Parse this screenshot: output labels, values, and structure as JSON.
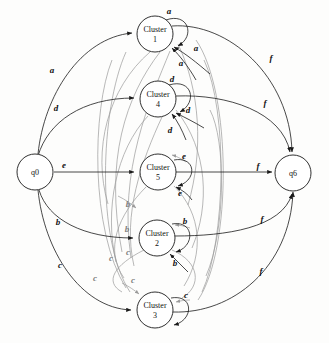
{
  "diagram": {
    "type": "state-transition-diagram",
    "colors": {
      "black_edge": "#1a1a1a",
      "gray_edge": "#9a9a9a",
      "node_fill": "#ffffff",
      "text": "#111111"
    },
    "nodes": [
      {
        "id": "q0",
        "label_line1": "q0",
        "label_line2": "",
        "cx": 35,
        "cy": 172,
        "r": 18
      },
      {
        "id": "c1",
        "label_line1": "Cluster",
        "label_line2": "1",
        "cx": 155,
        "cy": 34,
        "r": 18
      },
      {
        "id": "c4",
        "label_line1": "Cluster",
        "label_line2": "4",
        "cx": 158,
        "cy": 99,
        "r": 18
      },
      {
        "id": "c5",
        "label_line1": "Cluster",
        "label_line2": "5",
        "cx": 158,
        "cy": 172,
        "r": 18
      },
      {
        "id": "c2",
        "label_line1": "Cluster",
        "label_line2": "2",
        "cx": 157,
        "cy": 238,
        "r": 18
      },
      {
        "id": "c3",
        "label_line1": "Cluster",
        "label_line2": "3",
        "cx": 155,
        "cy": 310,
        "r": 18
      }
    ],
    "edge_labels": [
      {
        "id": "a-from-q0",
        "text": "a",
        "x": 52,
        "y": 73,
        "color": "black"
      },
      {
        "id": "d-from-q0",
        "text": "d",
        "x": 56,
        "y": 111,
        "color": "black"
      },
      {
        "id": "e-from-q0",
        "text": "e",
        "x": 64,
        "y": 168,
        "color": "black"
      },
      {
        "id": "b-from-q0",
        "text": "b",
        "x": 58,
        "y": 225,
        "color": "black"
      },
      {
        "id": "c-from-q0",
        "text": "c",
        "x": 60,
        "y": 268,
        "color": "black"
      },
      {
        "id": "a-selfloop",
        "text": "a",
        "x": 169,
        "y": 14,
        "color": "black"
      },
      {
        "id": "a-return-1",
        "text": "a",
        "x": 196,
        "y": 51,
        "color": "black"
      },
      {
        "id": "a-return-2",
        "text": "a",
        "x": 181,
        "y": 66,
        "color": "black"
      },
      {
        "id": "d-selfloop",
        "text": "d",
        "x": 172,
        "y": 82,
        "color": "black"
      },
      {
        "id": "d-return-1",
        "text": "d",
        "x": 188,
        "y": 113,
        "color": "black"
      },
      {
        "id": "d-return-2",
        "text": "d",
        "x": 170,
        "y": 133,
        "color": "black"
      },
      {
        "id": "e-selfloop",
        "text": "e",
        "x": 184,
        "y": 159,
        "color": "black"
      },
      {
        "id": "e-return-1",
        "text": "e",
        "x": 180,
        "y": 196,
        "color": "black"
      },
      {
        "id": "b-gray-in",
        "text": "b",
        "x": 128,
        "y": 207,
        "color": "gray"
      },
      {
        "id": "b-black-in",
        "text": "b",
        "x": 127,
        "y": 232,
        "color": "gray"
      },
      {
        "id": "b-selfloop",
        "text": "b",
        "x": 185,
        "y": 224,
        "color": "black"
      },
      {
        "id": "b-return-1",
        "text": "b",
        "x": 175,
        "y": 266,
        "color": "black"
      },
      {
        "id": "c-gray-1",
        "text": "c",
        "x": 111,
        "y": 261,
        "color": "gray"
      },
      {
        "id": "c-gray-2",
        "text": "c",
        "x": 128,
        "y": 255,
        "color": "gray"
      },
      {
        "id": "c-gray-3",
        "text": "c",
        "x": 95,
        "y": 281,
        "color": "gray"
      },
      {
        "id": "c-gray-4",
        "text": "c",
        "x": 133,
        "y": 283,
        "color": "gray"
      },
      {
        "id": "c-selfloop",
        "text": "c",
        "x": 186,
        "y": 298,
        "color": "black"
      },
      {
        "id": "f-top",
        "text": "f",
        "x": 271,
        "y": 61,
        "color": "black"
      },
      {
        "id": "f-upper",
        "text": "f",
        "x": 265,
        "y": 106,
        "color": "black"
      },
      {
        "id": "f-mid",
        "text": "f",
        "x": 258,
        "y": 169,
        "color": "black"
      },
      {
        "id": "f-lower",
        "text": "f",
        "x": 262,
        "y": 222,
        "color": "black"
      },
      {
        "id": "f-bottom",
        "text": "f",
        "x": 261,
        "y": 274,
        "color": "black"
      }
    ],
    "node_q6": {
      "id": "q6",
      "label": "q6",
      "cx": 293,
      "cy": 173,
      "r": 18
    }
  }
}
